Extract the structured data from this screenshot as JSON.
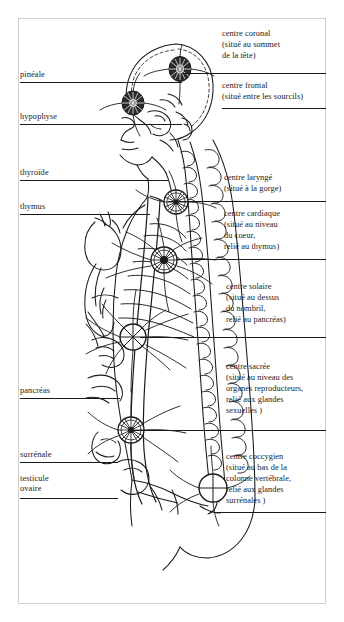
{
  "diagram": {
    "language": "fr",
    "ink_color": "#1a1a1a",
    "background": "#ffffff"
  },
  "gland_labels": [
    {
      "id": "pineale",
      "label": "pinéale",
      "x": 20,
      "y": 70,
      "line_y": 82,
      "line_x1": 20,
      "line_x2": 182
    },
    {
      "id": "hypophyse",
      "label": "hypophyse",
      "x": 20,
      "y": 112,
      "line_y": 124,
      "line_x1": 20,
      "line_x2": 182
    },
    {
      "id": "thyroide",
      "label": "thyroïde",
      "x": 20,
      "y": 168,
      "line_y": 180,
      "line_x1": 20,
      "line_x2": 168
    },
    {
      "id": "thymus",
      "label": "thymus",
      "x": 20,
      "y": 202,
      "line_y": 214,
      "line_x1": 20,
      "line_x2": 150
    },
    {
      "id": "pancreas",
      "label": "pancréas",
      "x": 20,
      "y": 386,
      "line_y": 398,
      "line_x1": 20,
      "line_x2": 120
    },
    {
      "id": "surrenale",
      "label": "surrénale",
      "x": 20,
      "y": 450,
      "line_y": 462,
      "line_x1": 20,
      "line_x2": 118
    },
    {
      "id": "testicule-ovaire",
      "label": "testicule",
      "label2": "ovaire",
      "x": 20,
      "y": 474,
      "line_y": 498,
      "line_x1": 20,
      "line_x2": 118
    }
  ],
  "chakra_blocks": [
    {
      "id": "centre-coronal",
      "lines": [
        "centre coronal",
        "(situé au sommet",
        "de la tête)"
      ],
      "x": 222,
      "y": 28,
      "line_y": 73,
      "line_x1": 182,
      "line_x2": 326
    },
    {
      "id": "centre-frontal",
      "lines": [
        "centre frontal",
        "(situé entre les sourcils)"
      ],
      "x": 222,
      "y": 80,
      "line_y": 108,
      "line_x1": 222,
      "line_x2": 326
    },
    {
      "id": "centre-larynge",
      "lines": [
        "centre  laryngé",
        "(situé à la gorge)"
      ],
      "x": 224,
      "y": 172,
      "line_y": 201,
      "line_x1": 168,
      "line_x2": 326
    },
    {
      "id": "centre-cardiaque",
      "lines": [
        "centre cardiaque",
        "(situé au niveau",
        "du coeur,",
        "relié au thymus)"
      ],
      "x": 224,
      "y": 208,
      "line_y": 259,
      "line_x1": 176,
      "line_x2": 326
    },
    {
      "id": "centre-solaire",
      "lines": [
        "centre solaire",
        "(situé au dessus",
        "du nombril,",
        "relié au pancréas)"
      ],
      "x": 226,
      "y": 281,
      "line_y": 337,
      "line_x1": 140,
      "line_x2": 326
    },
    {
      "id": "centre-sacree",
      "lines": [
        "centre sacrée",
        "(situé au niveau des",
        "organes reproducteurs,",
        "relié aux glandes",
        "sexuelles )"
      ],
      "x": 226,
      "y": 361,
      "line_y": 430,
      "line_x1": 134,
      "line_x2": 326
    },
    {
      "id": "centre-coccygien",
      "lines": [
        "centre coccygien",
        "(situé au bas de la",
        "colonne vertébrale,",
        "relié aux glandes",
        "surrénales )"
      ],
      "x": 226,
      "y": 451,
      "line_y": 512,
      "line_x1": 214,
      "line_x2": 326
    }
  ],
  "chakra_points": [
    {
      "id": "crown-chakra",
      "name": "centre coronal",
      "cx": 180,
      "cy": 69,
      "r": 11,
      "style": "filled"
    },
    {
      "id": "brow-chakra",
      "name": "centre frontal",
      "cx": 133,
      "cy": 103,
      "r": 11,
      "style": "filled"
    },
    {
      "id": "throat-chakra",
      "name": "centre laryngé",
      "cx": 176,
      "cy": 202,
      "r": 12,
      "style": "wheel"
    },
    {
      "id": "heart-chakra",
      "name": "centre cardiaque",
      "cx": 164,
      "cy": 260,
      "r": 13,
      "style": "wheel-dark"
    },
    {
      "id": "solar-plexus-chakra",
      "name": "centre solaire",
      "cx": 133,
      "cy": 337,
      "r": 13,
      "style": "cross"
    },
    {
      "id": "sacral-chakra",
      "name": "centre sacrée",
      "cx": 131,
      "cy": 430,
      "r": 13,
      "style": "wheel"
    },
    {
      "id": "coccyx-chakra",
      "name": "centre coccygien",
      "cx": 213,
      "cy": 488,
      "r": 14,
      "style": "cross"
    }
  ]
}
